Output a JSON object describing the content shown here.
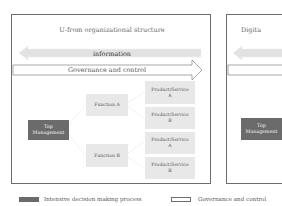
{
  "panels": [
    {
      "title": "U-from organizational structure",
      "information_arrow": {
        "label": "information",
        "direction": "left"
      },
      "governance_arrow": {
        "label": "Governance and control",
        "direction": "right"
      },
      "top_management": "Top\nManagement",
      "functions": [
        {
          "label": "Function A",
          "products": [
            "Product/Service\nA",
            "Product/Service\nB"
          ]
        },
        {
          "label": "Function B",
          "products": [
            "Product/Service\nA",
            "Product/Service\nB"
          ]
        }
      ]
    },
    {
      "title": "Digita",
      "top_management": "Top\nManagement"
    }
  ],
  "legend": [
    {
      "label": "Intensive decision making process",
      "swatch": "filled",
      "color": "#6b6b6b"
    },
    {
      "label": "Governance and control",
      "swatch": "outline",
      "color": "#ffffff"
    }
  ],
  "colors": {
    "dark_box": "#6b6b6b",
    "light_box": "#e8e8e8",
    "information_arrow": "#e2e2e2",
    "border": "#6d6d6d"
  }
}
